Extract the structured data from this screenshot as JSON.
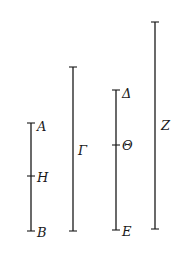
{
  "diagram": {
    "type": "line-segments",
    "segments": [
      {
        "id": "AB",
        "x": 31,
        "y_top": 123,
        "y_bottom": 231,
        "labels": {
          "top": "A",
          "mid": "H",
          "bottom": "B"
        },
        "mid_y": 176
      },
      {
        "id": "Gamma",
        "x": 73,
        "y_top": 67,
        "y_bottom": 231,
        "labels": {
          "side": "Γ"
        },
        "side_y": 152
      },
      {
        "id": "DeltaE",
        "x": 116,
        "y_top": 90,
        "y_bottom": 230,
        "labels": {
          "top": "Δ",
          "mid": "Θ",
          "bottom": "E"
        },
        "mid_y": 145
      },
      {
        "id": "Z",
        "x": 155,
        "y_top": 22,
        "y_bottom": 229,
        "labels": {
          "side": "Z"
        },
        "side_y": 127
      }
    ]
  }
}
